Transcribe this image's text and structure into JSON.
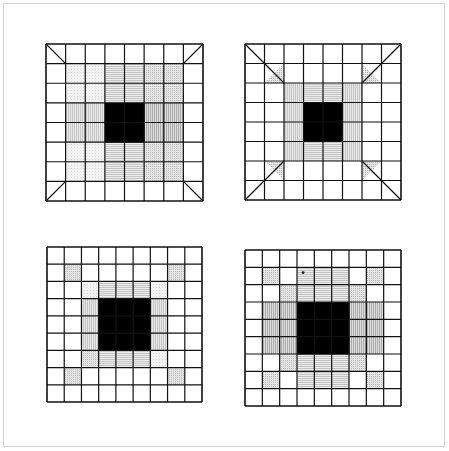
{
  "figure": {
    "frame_color": "#d4d4d4",
    "line_color": "#111111",
    "black": "#000000",
    "panels": [
      {
        "name": "panel-top-left",
        "x": 46,
        "y": 44,
        "size": 157,
        "n": 8,
        "diagonals": "corner-cells",
        "cells": [
          {
            "r": 1,
            "c": 1,
            "fill": "light"
          },
          {
            "r": 1,
            "c": 2,
            "fill": "light"
          },
          {
            "r": 2,
            "c": 1,
            "fill": "light"
          },
          {
            "r": 2,
            "c": 2,
            "fill": "light"
          },
          {
            "r": 1,
            "c": 3,
            "fill": "hlines"
          },
          {
            "r": 1,
            "c": 4,
            "fill": "hlines"
          },
          {
            "r": 2,
            "c": 3,
            "fill": "hlines"
          },
          {
            "r": 2,
            "c": 4,
            "fill": "hlines"
          },
          {
            "r": 1,
            "c": 5,
            "fill": "dots"
          },
          {
            "r": 1,
            "c": 6,
            "fill": "dots"
          },
          {
            "r": 2,
            "c": 5,
            "fill": "dots"
          },
          {
            "r": 2,
            "c": 6,
            "fill": "dots"
          },
          {
            "r": 3,
            "c": 1,
            "fill": "vlines"
          },
          {
            "r": 3,
            "c": 2,
            "fill": "vlines"
          },
          {
            "r": 4,
            "c": 1,
            "fill": "vlines"
          },
          {
            "r": 4,
            "c": 2,
            "fill": "vlines"
          },
          {
            "r": 3,
            "c": 5,
            "fill": "vlines-dark"
          },
          {
            "r": 3,
            "c": 6,
            "fill": "vlines-dark"
          },
          {
            "r": 4,
            "c": 5,
            "fill": "vlines-dark"
          },
          {
            "r": 4,
            "c": 6,
            "fill": "vlines-dark"
          },
          {
            "r": 5,
            "c": 1,
            "fill": "light"
          },
          {
            "r": 5,
            "c": 2,
            "fill": "light"
          },
          {
            "r": 6,
            "c": 1,
            "fill": "light"
          },
          {
            "r": 6,
            "c": 2,
            "fill": "light"
          },
          {
            "r": 5,
            "c": 3,
            "fill": "hlines"
          },
          {
            "r": 5,
            "c": 4,
            "fill": "hlines"
          },
          {
            "r": 6,
            "c": 3,
            "fill": "hlines"
          },
          {
            "r": 6,
            "c": 4,
            "fill": "hlines"
          },
          {
            "r": 5,
            "c": 5,
            "fill": "dots"
          },
          {
            "r": 5,
            "c": 6,
            "fill": "dots"
          },
          {
            "r": 6,
            "c": 5,
            "fill": "dots"
          },
          {
            "r": 6,
            "c": 6,
            "fill": "dots"
          },
          {
            "r": 3,
            "c": 3,
            "fill": "black"
          },
          {
            "r": 3,
            "c": 4,
            "fill": "black"
          },
          {
            "r": 4,
            "c": 3,
            "fill": "black"
          },
          {
            "r": 4,
            "c": 4,
            "fill": "black"
          }
        ]
      },
      {
        "name": "panel-top-right",
        "x": 245,
        "y": 44,
        "size": 156,
        "n": 8,
        "diagonals": "long-corners",
        "cells": [
          {
            "r": 1,
            "c": 1,
            "fill": "tri-dots-tl"
          },
          {
            "r": 1,
            "c": 6,
            "fill": "tri-dots-tr"
          },
          {
            "r": 6,
            "c": 1,
            "fill": "tri-dots-bl"
          },
          {
            "r": 6,
            "c": 6,
            "fill": "tri-dots-br"
          },
          {
            "r": 2,
            "c": 2,
            "fill": "vlines"
          },
          {
            "r": 3,
            "c": 2,
            "fill": "vlines"
          },
          {
            "r": 4,
            "c": 2,
            "fill": "vlines"
          },
          {
            "r": 5,
            "c": 2,
            "fill": "vlines"
          },
          {
            "r": 2,
            "c": 5,
            "fill": "vlines"
          },
          {
            "r": 3,
            "c": 5,
            "fill": "vlines"
          },
          {
            "r": 4,
            "c": 5,
            "fill": "vlines"
          },
          {
            "r": 5,
            "c": 5,
            "fill": "vlines"
          },
          {
            "r": 2,
            "c": 3,
            "fill": "hlines"
          },
          {
            "r": 2,
            "c": 4,
            "fill": "hlines"
          },
          {
            "r": 5,
            "c": 3,
            "fill": "hlines"
          },
          {
            "r": 5,
            "c": 4,
            "fill": "hlines"
          },
          {
            "r": 3,
            "c": 3,
            "fill": "black"
          },
          {
            "r": 3,
            "c": 4,
            "fill": "black"
          },
          {
            "r": 4,
            "c": 3,
            "fill": "black"
          },
          {
            "r": 4,
            "c": 4,
            "fill": "black"
          }
        ]
      },
      {
        "name": "panel-bottom-left",
        "x": 47,
        "y": 247,
        "size": 155,
        "n": 9,
        "diagonals": "none",
        "cells": [
          {
            "r": 1,
            "c": 1,
            "fill": "dots"
          },
          {
            "r": 1,
            "c": 7,
            "fill": "dots"
          },
          {
            "r": 7,
            "c": 1,
            "fill": "dots"
          },
          {
            "r": 7,
            "c": 7,
            "fill": "dots"
          },
          {
            "r": 2,
            "c": 2,
            "fill": "light"
          },
          {
            "r": 2,
            "c": 6,
            "fill": "light"
          },
          {
            "r": 6,
            "c": 2,
            "fill": "dots"
          },
          {
            "r": 6,
            "c": 6,
            "fill": "light"
          },
          {
            "r": 2,
            "c": 3,
            "fill": "hlines"
          },
          {
            "r": 2,
            "c": 4,
            "fill": "hlines"
          },
          {
            "r": 2,
            "c": 5,
            "fill": "hlines"
          },
          {
            "r": 6,
            "c": 3,
            "fill": "hlines"
          },
          {
            "r": 6,
            "c": 4,
            "fill": "hlines"
          },
          {
            "r": 6,
            "c": 5,
            "fill": "hlines"
          },
          {
            "r": 3,
            "c": 2,
            "fill": "vlines"
          },
          {
            "r": 4,
            "c": 2,
            "fill": "vlines"
          },
          {
            "r": 5,
            "c": 2,
            "fill": "vlines"
          },
          {
            "r": 3,
            "c": 6,
            "fill": "vlines"
          },
          {
            "r": 4,
            "c": 6,
            "fill": "vlines"
          },
          {
            "r": 5,
            "c": 6,
            "fill": "vlines"
          },
          {
            "r": 3,
            "c": 3,
            "fill": "black"
          },
          {
            "r": 3,
            "c": 4,
            "fill": "black"
          },
          {
            "r": 3,
            "c": 5,
            "fill": "black"
          },
          {
            "r": 4,
            "c": 3,
            "fill": "black"
          },
          {
            "r": 4,
            "c": 4,
            "fill": "black"
          },
          {
            "r": 4,
            "c": 5,
            "fill": "black"
          },
          {
            "r": 5,
            "c": 3,
            "fill": "black"
          },
          {
            "r": 5,
            "c": 4,
            "fill": "black"
          },
          {
            "r": 5,
            "c": 5,
            "fill": "black"
          }
        ]
      },
      {
        "name": "panel-bottom-right",
        "x": 245,
        "y": 250,
        "size": 156,
        "n": 9,
        "diagonals": "none",
        "marker": {
          "r": 1,
          "c": 3,
          "dx": 0.35,
          "dy": 0.3
        },
        "cells": [
          {
            "r": 1,
            "c": 1,
            "fill": "dots"
          },
          {
            "r": 1,
            "c": 7,
            "fill": "dots"
          },
          {
            "r": 2,
            "c": 2,
            "fill": "dots"
          },
          {
            "r": 2,
            "c": 6,
            "fill": "dots"
          },
          {
            "r": 6,
            "c": 2,
            "fill": "dots"
          },
          {
            "r": 6,
            "c": 6,
            "fill": "dots"
          },
          {
            "r": 7,
            "c": 1,
            "fill": "dots"
          },
          {
            "r": 7,
            "c": 7,
            "fill": "dots"
          },
          {
            "r": 1,
            "c": 3,
            "fill": "hlines"
          },
          {
            "r": 1,
            "c": 4,
            "fill": "hlines"
          },
          {
            "r": 1,
            "c": 5,
            "fill": "hlines"
          },
          {
            "r": 2,
            "c": 3,
            "fill": "hlines"
          },
          {
            "r": 2,
            "c": 4,
            "fill": "hlines"
          },
          {
            "r": 2,
            "c": 5,
            "fill": "hlines"
          },
          {
            "r": 6,
            "c": 3,
            "fill": "hlines"
          },
          {
            "r": 6,
            "c": 4,
            "fill": "hlines"
          },
          {
            "r": 6,
            "c": 5,
            "fill": "hlines"
          },
          {
            "r": 7,
            "c": 3,
            "fill": "hlines"
          },
          {
            "r": 7,
            "c": 4,
            "fill": "hlines"
          },
          {
            "r": 7,
            "c": 5,
            "fill": "hlines"
          },
          {
            "r": 3,
            "c": 1,
            "fill": "vlines-dark"
          },
          {
            "r": 4,
            "c": 1,
            "fill": "vlines-dark"
          },
          {
            "r": 5,
            "c": 1,
            "fill": "vlines-dark"
          },
          {
            "r": 3,
            "c": 2,
            "fill": "vlines-dark"
          },
          {
            "r": 4,
            "c": 2,
            "fill": "vlines-dark"
          },
          {
            "r": 5,
            "c": 2,
            "fill": "vlines-dark"
          },
          {
            "r": 3,
            "c": 6,
            "fill": "vlines-dark"
          },
          {
            "r": 4,
            "c": 6,
            "fill": "vlines-dark"
          },
          {
            "r": 5,
            "c": 6,
            "fill": "vlines-dark"
          },
          {
            "r": 3,
            "c": 7,
            "fill": "vlines-dark"
          },
          {
            "r": 4,
            "c": 7,
            "fill": "vlines-dark"
          },
          {
            "r": 5,
            "c": 7,
            "fill": "vlines-dark"
          },
          {
            "r": 3,
            "c": 3,
            "fill": "black"
          },
          {
            "r": 3,
            "c": 4,
            "fill": "black"
          },
          {
            "r": 3,
            "c": 5,
            "fill": "black"
          },
          {
            "r": 4,
            "c": 3,
            "fill": "black"
          },
          {
            "r": 4,
            "c": 4,
            "fill": "black"
          },
          {
            "r": 4,
            "c": 5,
            "fill": "black"
          },
          {
            "r": 5,
            "c": 3,
            "fill": "black"
          },
          {
            "r": 5,
            "c": 4,
            "fill": "black"
          },
          {
            "r": 5,
            "c": 5,
            "fill": "black"
          }
        ]
      }
    ]
  }
}
